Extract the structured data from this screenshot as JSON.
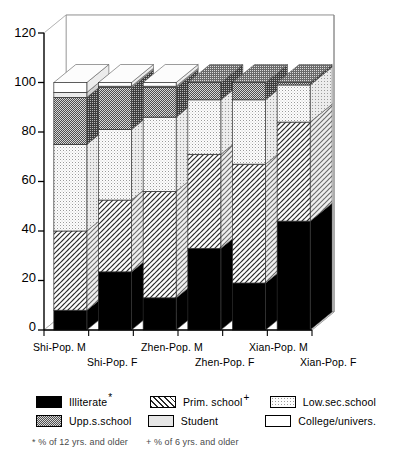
{
  "chart_data": {
    "type": "bar",
    "subtype": "stacked-3d-column",
    "title": "",
    "xlabel": "",
    "ylabel": "",
    "ylim": [
      0,
      120
    ],
    "yticks": [
      "0",
      "20",
      "40",
      "60",
      "80",
      "100",
      "120"
    ],
    "grid": true,
    "legend_position": "bottom",
    "categories": [
      "Shi-Pop. M",
      "Shi-Pop. F",
      "Zhen-Pop. M",
      "Zhen-Pop. F",
      "Xian-Pop. M",
      "Xian-Pop. F"
    ],
    "series": [
      {
        "name": "Illiterate",
        "pattern": "solid-black",
        "values": [
          8,
          23.5,
          13,
          33,
          19,
          44
        ]
      },
      {
        "name": "Prim. school",
        "pattern": "diagonal-hatch",
        "values": [
          32,
          29,
          43,
          38,
          48,
          40
        ]
      },
      {
        "name": "Low.sec.school",
        "pattern": "fine-dots",
        "values": [
          35,
          28.5,
          30,
          22,
          26,
          15
        ]
      },
      {
        "name": "Upp.s.school",
        "pattern": "dense-checker",
        "values": [
          19,
          17,
          12,
          7,
          7,
          1
        ]
      },
      {
        "name": "Student",
        "pattern": "light-gray",
        "values": [
          2,
          0.5,
          0.5,
          0,
          0,
          0
        ]
      },
      {
        "name": "College/univers.",
        "pattern": "white",
        "values": [
          4,
          1.5,
          1.5,
          0,
          0,
          0
        ]
      }
    ],
    "segment_tops": [
      [
        8,
        40,
        75,
        94,
        96,
        100
      ],
      [
        23.5,
        52.5,
        81,
        98,
        98.5,
        100
      ],
      [
        13,
        56,
        86,
        98,
        98.5,
        100
      ],
      [
        33,
        71,
        93,
        100,
        100,
        100
      ],
      [
        19,
        67,
        93,
        100,
        100,
        100
      ],
      [
        44,
        84,
        99,
        100,
        100,
        100
      ]
    ]
  },
  "legend": {
    "items": [
      {
        "label": "Illiterate",
        "marker": "*",
        "pattern": "solid-black"
      },
      {
        "label": "Prim. school",
        "marker": "+",
        "pattern": "diagonal-hatch"
      },
      {
        "label": "Low.sec.school",
        "marker": "",
        "pattern": "fine-dots"
      },
      {
        "label": "Upp.s.school",
        "marker": "",
        "pattern": "dense-checker"
      },
      {
        "label": "Student",
        "marker": "",
        "pattern": "light-gray"
      },
      {
        "label": "College/univers.",
        "marker": "",
        "pattern": "white"
      }
    ]
  },
  "footnotes": {
    "star": "* % of 12 yrs. and older",
    "plus": "+ % of 6 yrs. and older"
  },
  "colors": {
    "axis": "#000000",
    "grid": "#c8c8c8",
    "illiterate": "#000000",
    "prim_school": "#ffffff",
    "low_sec_school": "#f2f2f2",
    "upp_s_school": "#7a7a7a",
    "student": "#e6e6e6",
    "college": "#ffffff"
  }
}
